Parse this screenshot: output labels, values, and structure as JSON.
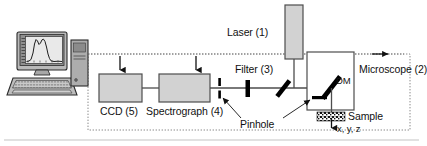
{
  "figure": {
    "background_color": "#ffffff",
    "line_color": "#1a1a1a",
    "box_fill": "#d2d2d2",
    "box_stroke": "#4d4d4d",
    "dotted_color": "#7a7a7a",
    "optic_color": "#000000"
  },
  "labels": {
    "laser": "Laser (1)",
    "microscope": "Microscope (2)",
    "filter": "Filter (3)",
    "spectrograph": "Spectrograph (4)",
    "ccd": "CCD (5)",
    "pinhole": "Pinhole",
    "dm": "DM",
    "sample": "Sample",
    "axes": "x, y, z"
  },
  "components": [
    {
      "name": "computer",
      "label": "",
      "kind": "workstation"
    },
    {
      "name": "ccd",
      "label": "CCD (5)",
      "kind": "box"
    },
    {
      "name": "spectrograph",
      "label": "Spectrograph (4)",
      "kind": "box"
    },
    {
      "name": "pinhole",
      "label": "Pinhole",
      "kind": "aperture"
    },
    {
      "name": "filter",
      "label": "Filter (3)",
      "kind": "optic-bar"
    },
    {
      "name": "mirror",
      "label": "",
      "kind": "mirror"
    },
    {
      "name": "dichroic-mirror",
      "label": "DM",
      "kind": "mirror"
    },
    {
      "name": "laser",
      "label": "Laser (1)",
      "kind": "box"
    },
    {
      "name": "microscope",
      "label": "Microscope (2)",
      "kind": "box"
    },
    {
      "name": "objective",
      "label": "",
      "kind": "optic-bar"
    },
    {
      "name": "sample",
      "label": "Sample",
      "kind": "textured"
    },
    {
      "name": "stage-axes",
      "label": "x, y, z",
      "kind": "arrow"
    }
  ],
  "monitor": {
    "plot_type": "spectrum",
    "peaks": 2
  }
}
